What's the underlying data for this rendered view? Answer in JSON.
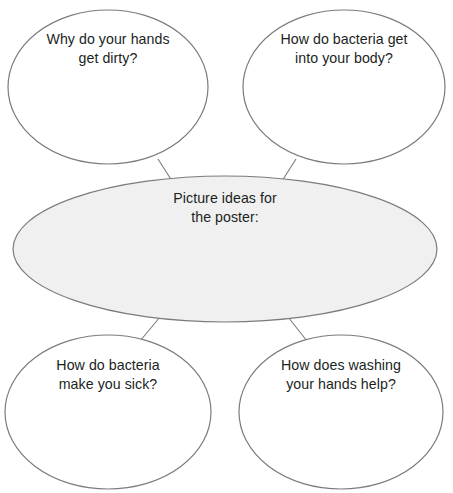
{
  "document": {
    "kind": "mind-map-worksheet",
    "clipped_top_fragment": "sick."
  },
  "style": {
    "background": "#ffffff",
    "center_fill": "#f0f0f0",
    "center_stroke": "#7b7b7b",
    "bubble_fill": "#ffffff",
    "bubble_stroke": "#7b7b7b",
    "connector_stroke": "#7b7b7b",
    "text_color": "#211f1e"
  },
  "center": {
    "label": "Picture ideas for\nthe poster:",
    "line1": "Picture ideas for",
    "line2": "the poster:"
  },
  "branches": [
    {
      "id": "top-left",
      "label": "Why do your hands\nget dirty?",
      "line1": "Why do your hands",
      "line2": "get dirty?"
    },
    {
      "id": "top-right",
      "label": "How do bacteria get\ninto your body?",
      "line1": "How do bacteria get",
      "line2": "into your body?"
    },
    {
      "id": "bottom-left",
      "label": "How do bacteria\nmake you sick?",
      "line1": "How do bacteria",
      "line2": "make you sick?"
    },
    {
      "id": "bottom-right",
      "label": "How does washing\nyour hands help?",
      "line1": "How does washing",
      "line2": "your hands help?"
    }
  ]
}
